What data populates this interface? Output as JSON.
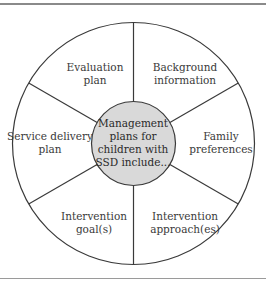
{
  "diagram": {
    "type": "pie-wheel",
    "center": {
      "lines": [
        "Management",
        "plans for",
        "children with",
        "SSD include..."
      ],
      "fill": "#d9d9d9"
    },
    "segments": [
      {
        "id": "evaluation-plan",
        "lines": [
          "Evaluation",
          "plan"
        ]
      },
      {
        "id": "background-information",
        "lines": [
          "Background",
          "information"
        ]
      },
      {
        "id": "family-preferences",
        "lines": [
          "Family",
          "preferences"
        ]
      },
      {
        "id": "intervention-approaches",
        "lines": [
          "Intervention",
          "approach(es)"
        ]
      },
      {
        "id": "intervention-goals",
        "lines": [
          "Intervention",
          "goal(s)"
        ]
      },
      {
        "id": "service-delivery-plan",
        "lines": [
          "Service delivery",
          "plan"
        ]
      }
    ],
    "colors": {
      "stroke": "#3a3a3a",
      "text": "#3a3a3a",
      "border": "#8a8a8a"
    }
  }
}
